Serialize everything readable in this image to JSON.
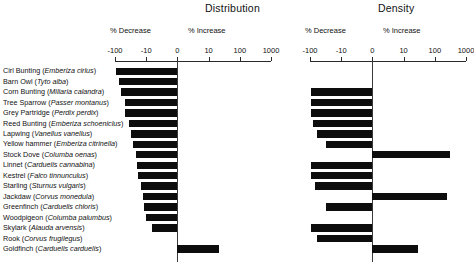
{
  "figure": {
    "panels": [
      {
        "id": "distribution",
        "title": "Distribution",
        "decrease_label": "% Decrease",
        "increase_label": "% Increase",
        "ticks": [
          "-100",
          "-10",
          "0",
          "10",
          "100",
          "1000"
        ]
      },
      {
        "id": "density",
        "title": "Density",
        "decrease_label": "% Decrease",
        "increase_label": "% Increase",
        "ticks": [
          "-100",
          "-10",
          "0",
          "10",
          "100",
          "1000"
        ]
      }
    ]
  },
  "chart_data": {
    "type": "bar",
    "orientation": "horizontal",
    "axis_scale": "symlog",
    "axis_ticks": [
      -100,
      -10,
      0,
      10,
      100,
      1000
    ],
    "xlabel": "",
    "ylabel": "",
    "grid": false,
    "legend": "none",
    "categories": [
      "Cirl Bunting (Emberiza cirlus)",
      "Barn Owl (Tyto alba)",
      "Corn Bunting (Miliaria calandra)",
      "Tree Sparrow (Passer montanus)",
      "Grey Partridge (Perdix perdix)",
      "Reed Bunting (Emberiza schoeniclus)",
      "Lapwing (Vanellus vanellus)",
      "Yellow hammer (Emberiza citrinella)",
      "Stock Dove (Columba oenas)",
      "Linnet (Carduelis cannabina)",
      "Kestrel (Falco tinnunculus)",
      "Starling (Sturnus vulgaris)",
      "Jackdaw (Corvus monedula)",
      "Greenfinch (Carduelis chloris)",
      "Woodpigeon (Columba palumbus)",
      "Skylark (Alauda arvensis)",
      "Rook (Corvus frugilegus)",
      "Goldfinch (Carduelis carduelis)"
    ],
    "species": [
      {
        "common": "Cirl Bunting",
        "latin": "Emberiza cirlus"
      },
      {
        "common": "Barn Owl",
        "latin": "Tyto alba"
      },
      {
        "common": "Corn Bunting",
        "latin": "Miliaria calandra"
      },
      {
        "common": "Tree Sparrow",
        "latin": "Passer montanus"
      },
      {
        "common": "Grey Partridge",
        "latin": "Perdix perdix"
      },
      {
        "common": "Reed Bunting",
        "latin": "Emberiza schoeniclus"
      },
      {
        "common": "Lapwing",
        "latin": "Vanellus vanellus"
      },
      {
        "common": "Yellow hammer",
        "latin": "Emberiza citrinella"
      },
      {
        "common": "Stock Dove",
        "latin": "Columba oenas"
      },
      {
        "common": "Linnet",
        "latin": "Carduelis cannabina"
      },
      {
        "common": "Kestrel",
        "latin": "Falco tinnunculus"
      },
      {
        "common": "Starling",
        "latin": "Sturnus vulgaris"
      },
      {
        "common": "Jackdaw",
        "latin": "Corvus monedula"
      },
      {
        "common": "Greenfinch",
        "latin": "Carduelis chloris"
      },
      {
        "common": "Woodpigeon",
        "latin": "Columba palumbus"
      },
      {
        "common": "Skylark",
        "latin": "Alauda arvensis"
      },
      {
        "common": "Rook",
        "latin": "Corvus frugilegus"
      },
      {
        "common": "Goldfinch",
        "latin": "Carduelis carduelis"
      }
    ],
    "series": [
      {
        "name": "Distribution",
        "values": [
          -95,
          -72,
          -62,
          -48,
          -48,
          -35,
          -30,
          -26,
          -22,
          -20,
          -18,
          -15,
          -13,
          -12,
          -10,
          -8,
          null,
          22
        ]
      },
      {
        "name": "Density",
        "values": [
          null,
          null,
          -90,
          -90,
          -90,
          -80,
          -60,
          -30,
          300,
          -92,
          -93,
          -70,
          250,
          -30,
          null,
          -92,
          -60,
          28
        ]
      }
    ],
    "colors": {
      "bar": "#0d0d0d",
      "axis": "#2a2a2a",
      "text": "#111111",
      "background": "#ffffff"
    }
  }
}
